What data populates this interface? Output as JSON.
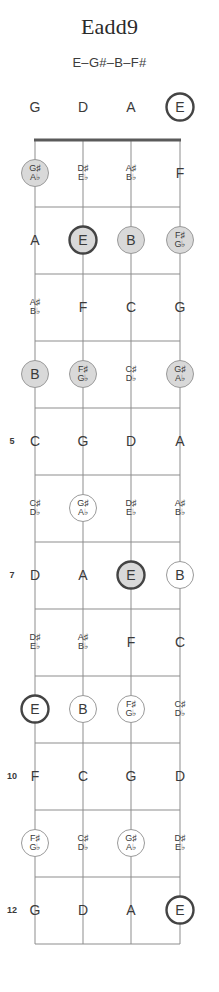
{
  "header": {
    "title": "Eadd9",
    "subtitle": "E–G#–B–F#"
  },
  "colors": {
    "ink": "#3a3a3a",
    "line": "#8d8d8d",
    "nut": "#5a5a5a",
    "fill_gray": "#d9d9d9",
    "fill_white": "#ffffff",
    "root_ring": "#444444",
    "note_ring": "#9a9a9a"
  },
  "diagram": {
    "type": "fretboard",
    "instrument_strings": 4,
    "string_open_notes": [
      "G",
      "D",
      "A",
      "E"
    ],
    "fret_count": 12,
    "fret_numbers_shown": [
      5,
      7,
      10,
      12
    ],
    "chord_tones": [
      "E",
      "G#",
      "B",
      "F#"
    ],
    "root": "E",
    "marker_styles": {
      "root": "thick dark ring",
      "chord_tone": "thin ring",
      "non_chord": "no ring"
    },
    "rows": [
      {
        "fret": 0,
        "fret_label": "",
        "cells": [
          {
            "note": "G",
            "alt": "",
            "marker": "none"
          },
          {
            "note": "D",
            "alt": "",
            "marker": "none"
          },
          {
            "note": "A",
            "alt": "",
            "marker": "none"
          },
          {
            "note": "E",
            "alt": "",
            "marker": "root-open"
          }
        ]
      },
      {
        "fret": 1,
        "fret_label": "",
        "cells": [
          {
            "note": "G♯",
            "alt": "A♭",
            "marker": "tone-filled"
          },
          {
            "note": "D♯",
            "alt": "E♭",
            "marker": "none"
          },
          {
            "note": "A♯",
            "alt": "B♭",
            "marker": "none"
          },
          {
            "note": "F",
            "alt": "",
            "marker": "none"
          }
        ]
      },
      {
        "fret": 2,
        "fret_label": "",
        "cells": [
          {
            "note": "A",
            "alt": "",
            "marker": "none"
          },
          {
            "note": "E",
            "alt": "",
            "marker": "root-filled"
          },
          {
            "note": "B",
            "alt": "",
            "marker": "tone-filled"
          },
          {
            "note": "F♯",
            "alt": "G♭",
            "marker": "tone-filled"
          }
        ]
      },
      {
        "fret": 3,
        "fret_label": "",
        "cells": [
          {
            "note": "A♯",
            "alt": "B♭",
            "marker": "none"
          },
          {
            "note": "F",
            "alt": "",
            "marker": "none"
          },
          {
            "note": "C",
            "alt": "",
            "marker": "none"
          },
          {
            "note": "G",
            "alt": "",
            "marker": "none"
          }
        ]
      },
      {
        "fret": 4,
        "fret_label": "",
        "cells": [
          {
            "note": "B",
            "alt": "",
            "marker": "tone-filled"
          },
          {
            "note": "F♯",
            "alt": "G♭",
            "marker": "tone-filled"
          },
          {
            "note": "C♯",
            "alt": "D♭",
            "marker": "none"
          },
          {
            "note": "G♯",
            "alt": "A♭",
            "marker": "tone-filled"
          }
        ]
      },
      {
        "fret": 5,
        "fret_label": "5",
        "cells": [
          {
            "note": "C",
            "alt": "",
            "marker": "none"
          },
          {
            "note": "G",
            "alt": "",
            "marker": "none"
          },
          {
            "note": "D",
            "alt": "",
            "marker": "none"
          },
          {
            "note": "A",
            "alt": "",
            "marker": "none"
          }
        ]
      },
      {
        "fret": 6,
        "fret_label": "",
        "cells": [
          {
            "note": "C♯",
            "alt": "D♭",
            "marker": "none"
          },
          {
            "note": "G♯",
            "alt": "A♭",
            "marker": "tone-open"
          },
          {
            "note": "D♯",
            "alt": "E♭",
            "marker": "none"
          },
          {
            "note": "A♯",
            "alt": "B♭",
            "marker": "none"
          }
        ]
      },
      {
        "fret": 7,
        "fret_label": "7",
        "cells": [
          {
            "note": "D",
            "alt": "",
            "marker": "none"
          },
          {
            "note": "A",
            "alt": "",
            "marker": "none"
          },
          {
            "note": "E",
            "alt": "",
            "marker": "root-filled"
          },
          {
            "note": "B",
            "alt": "",
            "marker": "tone-open"
          }
        ]
      },
      {
        "fret": 8,
        "fret_label": "",
        "cells": [
          {
            "note": "D♯",
            "alt": "E♭",
            "marker": "none"
          },
          {
            "note": "A♯",
            "alt": "B♭",
            "marker": "none"
          },
          {
            "note": "F",
            "alt": "",
            "marker": "none"
          },
          {
            "note": "C",
            "alt": "",
            "marker": "none"
          }
        ]
      },
      {
        "fret": 9,
        "fret_label": "",
        "cells": [
          {
            "note": "E",
            "alt": "",
            "marker": "root-open"
          },
          {
            "note": "B",
            "alt": "",
            "marker": "tone-open"
          },
          {
            "note": "F♯",
            "alt": "G♭",
            "marker": "tone-open"
          },
          {
            "note": "C♯",
            "alt": "D♭",
            "marker": "none"
          }
        ]
      },
      {
        "fret": 10,
        "fret_label": "10",
        "cells": [
          {
            "note": "F",
            "alt": "",
            "marker": "none"
          },
          {
            "note": "C",
            "alt": "",
            "marker": "none"
          },
          {
            "note": "G",
            "alt": "",
            "marker": "none"
          },
          {
            "note": "D",
            "alt": "",
            "marker": "none"
          }
        ]
      },
      {
        "fret": 11,
        "fret_label": "",
        "cells": [
          {
            "note": "F♯",
            "alt": "G♭",
            "marker": "tone-open"
          },
          {
            "note": "C♯",
            "alt": "D♭",
            "marker": "none"
          },
          {
            "note": "G♯",
            "alt": "A♭",
            "marker": "tone-open"
          },
          {
            "note": "D♯",
            "alt": "E♭",
            "marker": "none"
          }
        ]
      },
      {
        "fret": 12,
        "fret_label": "12",
        "cells": [
          {
            "note": "G",
            "alt": "",
            "marker": "none"
          },
          {
            "note": "D",
            "alt": "",
            "marker": "none"
          },
          {
            "note": "A",
            "alt": "",
            "marker": "none"
          },
          {
            "note": "E",
            "alt": "",
            "marker": "root-open"
          }
        ]
      }
    ]
  },
  "geometry": {
    "string_x": [
      35,
      83,
      131,
      180
    ],
    "nut_y": 140,
    "row_step": 67,
    "label_offset": 33,
    "fret_num_x": 12
  }
}
